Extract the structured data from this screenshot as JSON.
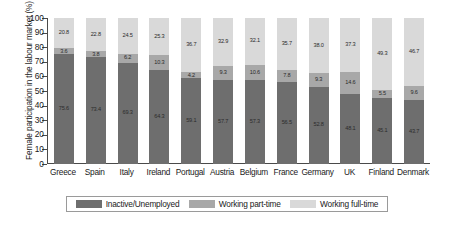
{
  "chart_data": {
    "type": "bar",
    "stacked": true,
    "title": "",
    "xlabel": "",
    "ylabel": "Female participation in the labour market (%)",
    "ylim": [
      0,
      100
    ],
    "yticks": [
      0,
      10,
      20,
      30,
      40,
      50,
      60,
      70,
      80,
      90,
      100
    ],
    "grid": false,
    "legend_position": "bottom",
    "categories": [
      "Greece",
      "Spain",
      "Italy",
      "Ireland",
      "Portugal",
      "Austria",
      "Belgium",
      "France",
      "Germany",
      "UK",
      "Finland",
      "Denmark"
    ],
    "series": [
      {
        "name": "Inactive/Unemployed",
        "color": "#6e6e6e",
        "values": [
          75.6,
          73.4,
          69.3,
          64.3,
          59.1,
          57.7,
          57.3,
          56.5,
          52.8,
          48.1,
          45.1,
          43.7
        ]
      },
      {
        "name": "Working part-time",
        "color": "#a8a8a8",
        "values": [
          3.6,
          3.8,
          6.2,
          10.3,
          4.2,
          9.3,
          10.6,
          7.8,
          9.3,
          14.6,
          5.5,
          9.6
        ]
      },
      {
        "name": "Working full-time",
        "color": "#d9d9d9",
        "values": [
          20.8,
          22.8,
          24.5,
          25.3,
          36.7,
          32.9,
          32.1,
          35.7,
          38.0,
          37.3,
          49.3,
          46.7
        ]
      }
    ],
    "bar_labels": {
      "Greece": {
        "inactive": "75.6",
        "part_time": "3.6",
        "full_time": "20.8"
      },
      "Spain": {
        "inactive": "73.4",
        "part_time": "3.8",
        "full_time": "22.8"
      },
      "Italy": {
        "inactive": "69.3",
        "part_time": "6.2",
        "full_time": "24.5"
      },
      "Ireland": {
        "inactive": "64.3",
        "part_time": "10.3",
        "full_time": "25.3"
      },
      "Portugal": {
        "inactive": "59.1",
        "part_time": "4.2",
        "full_time": "36.7"
      },
      "Austria": {
        "inactive": "57.7",
        "part_time": "9.3",
        "full_time": "32.9"
      },
      "Belgium": {
        "inactive": "57.3",
        "part_time": "10.6",
        "full_time": "32.1"
      },
      "France": {
        "inactive": "56.5",
        "part_time": "7.8",
        "full_time": "35.7"
      },
      "Germany": {
        "inactive": "52.8",
        "part_time": "9.3",
        "full_time": "38.0"
      },
      "UK": {
        "inactive": "48.1",
        "part_time": "14.6",
        "full_time": "37.3"
      },
      "Finland": {
        "inactive": "45.1",
        "part_time": "5.5",
        "full_time": "49.3"
      },
      "Denmark": {
        "inactive": "43.7",
        "part_time": "9.6",
        "full_time": "46.7"
      }
    }
  },
  "axis": {
    "y_title": "Female participation in the labour market (%)",
    "y_tick_labels": [
      "100",
      "90",
      "80",
      "70",
      "60",
      "50",
      "40",
      "30",
      "20",
      "10",
      "0"
    ]
  },
  "legend": {
    "items": [
      {
        "label": "Inactive/Unemployed",
        "color": "#6e6e6e"
      },
      {
        "label": "Working part-time",
        "color": "#a8a8a8"
      },
      {
        "label": "Working full-time",
        "color": "#d9d9d9"
      }
    ]
  }
}
